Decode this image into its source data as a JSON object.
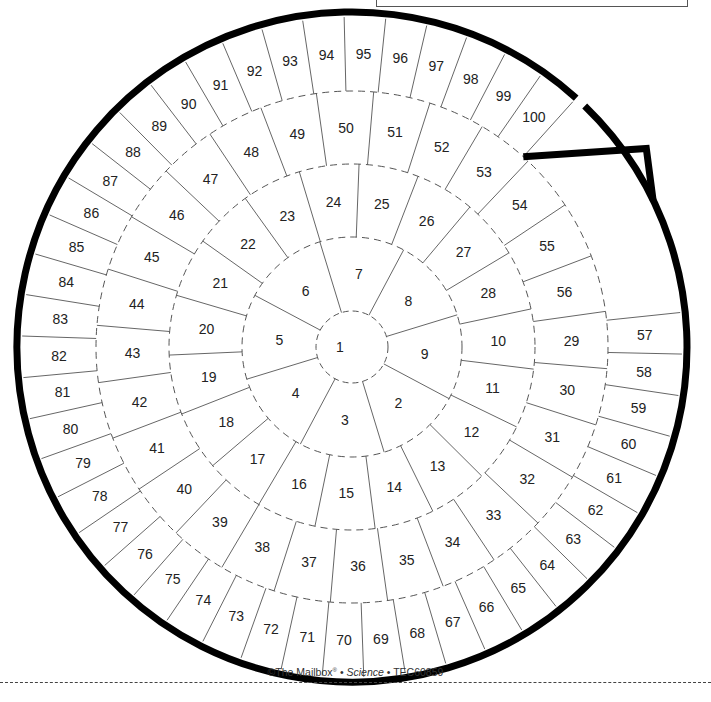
{
  "board": {
    "title": "Spiral game board",
    "start_cell": "1",
    "end_cell": "100",
    "stroke_color": "#000000",
    "grid_color": "#555555",
    "rings": [
      {
        "name": "center",
        "cells": [
          "1"
        ]
      },
      {
        "name": "ring-1",
        "cells": [
          "2",
          "3",
          "4",
          "5",
          "6",
          "7",
          "8",
          "9"
        ]
      },
      {
        "name": "ring-2",
        "cells": [
          "10",
          "11",
          "12",
          "13",
          "14",
          "15",
          "16",
          "17",
          "18",
          "19",
          "20",
          "21",
          "22",
          "23",
          "24",
          "25",
          "26",
          "27",
          "28"
        ]
      },
      {
        "name": "ring-3",
        "cells": [
          "29",
          "30",
          "31",
          "32",
          "33",
          "34",
          "35",
          "36",
          "37",
          "38",
          "39",
          "40",
          "41",
          "42",
          "43",
          "44",
          "45",
          "46",
          "47",
          "48",
          "49",
          "50",
          "51",
          "52",
          "53",
          "54",
          "55",
          "56"
        ]
      },
      {
        "name": "ring-4",
        "cells": [
          "57",
          "58",
          "59",
          "60",
          "61",
          "62",
          "63",
          "64",
          "65",
          "66",
          "67",
          "68",
          "69",
          "70",
          "71",
          "72",
          "73",
          "74",
          "75",
          "76",
          "77",
          "78",
          "79",
          "80",
          "81",
          "82",
          "83",
          "84",
          "85",
          "86",
          "87",
          "88",
          "89",
          "90",
          "91",
          "92",
          "93",
          "94",
          "95",
          "96",
          "97",
          "98",
          "99",
          "100"
        ]
      }
    ]
  },
  "footer": {
    "copyright_prefix": "©The Mailbox",
    "registered": "®",
    "separator": " • ",
    "subject": "Science",
    "code": "TEC60859"
  },
  "cut_line": {
    "style": "dashed"
  }
}
